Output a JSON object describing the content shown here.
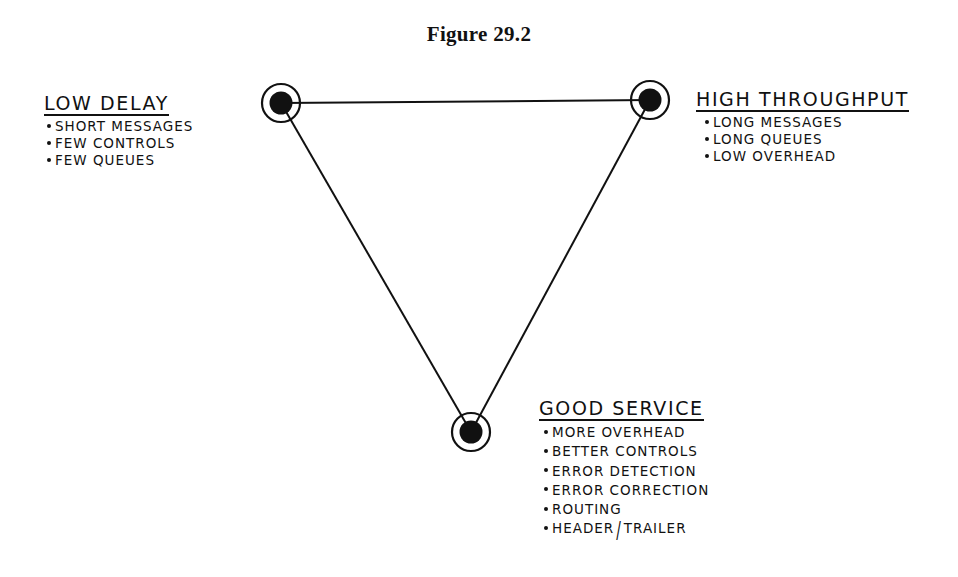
{
  "figure": {
    "title": "Figure 29.2"
  },
  "diagram": {
    "type": "triangle-tradeoff",
    "nodes": [
      {
        "id": "low-delay",
        "cx": 281,
        "cy": 103
      },
      {
        "id": "high-throughput",
        "cx": 650,
        "cy": 100
      },
      {
        "id": "good-service",
        "cx": 471,
        "cy": 432
      }
    ],
    "edges": [
      [
        "low-delay",
        "high-throughput"
      ],
      [
        "high-throughput",
        "good-service"
      ],
      [
        "good-service",
        "low-delay"
      ]
    ],
    "line_color": "#111111"
  },
  "labels": {
    "low_delay": {
      "heading": "LOW DELAY",
      "items": [
        "SHORT MESSAGES",
        "FEW CONTROLS",
        "FEW QUEUES"
      ]
    },
    "high_throughput": {
      "heading": "HIGH THROUGHPUT",
      "items": [
        "LONG MESSAGES",
        "LONG QUEUES",
        "LOW OVERHEAD"
      ]
    },
    "good_service": {
      "heading": "GOOD SERVICE",
      "items": [
        "MORE OVERHEAD",
        "BETTER CONTROLS",
        "ERROR DETECTION",
        "ERROR CORRECTION",
        "ROUTING"
      ],
      "last_item_parts": [
        "HEADER",
        "/",
        "TRAILER"
      ]
    }
  }
}
